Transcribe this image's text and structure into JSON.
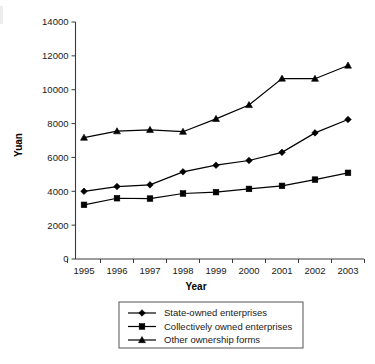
{
  "chart_data": {
    "type": "line",
    "title": "",
    "xlabel": "Year",
    "ylabel": "Yuan",
    "categories": [
      "1995",
      "1996",
      "1997",
      "1998",
      "1999",
      "2000",
      "2001",
      "2002",
      "2003"
    ],
    "ylim": [
      0,
      14000
    ],
    "yticks": [
      0,
      2000,
      4000,
      6000,
      8000,
      10000,
      12000,
      14000
    ],
    "ytick_labels": [
      "0",
      "2000",
      "4000",
      "6000",
      "8000",
      "10000",
      "12000",
      "14000"
    ],
    "grid": false,
    "legend_position": "bottom",
    "series": [
      {
        "name": "State-owned enterprises",
        "marker": "diamond",
        "values": [
          4000,
          4280,
          4380,
          5150,
          5540,
          5820,
          6300,
          7450,
          8240
        ]
      },
      {
        "name": "Collectively owned enterprises",
        "marker": "square",
        "values": [
          3200,
          3590,
          3570,
          3870,
          3950,
          4140,
          4320,
          4690,
          5090
        ]
      },
      {
        "name": "Other ownership forms",
        "marker": "triangle",
        "values": [
          7170,
          7550,
          7630,
          7520,
          8280,
          9100,
          10660,
          10650,
          11430
        ]
      }
    ]
  },
  "legend": {
    "items": [
      {
        "label": "State-owned enterprises",
        "marker": "diamond"
      },
      {
        "label": "Collectively owned enterprises",
        "marker": "square"
      },
      {
        "label": "Other ownership forms",
        "marker": "triangle"
      }
    ]
  },
  "colors": {
    "ink": "#000000",
    "axis": "#3a3a3a",
    "text": "#1a1a1a",
    "legend_border": "#555555",
    "background": "#ffffff"
  }
}
